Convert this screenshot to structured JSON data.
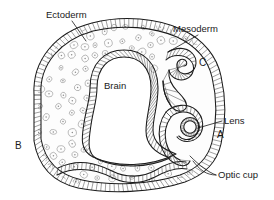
{
  "figure": {
    "background_color": "#ffffff",
    "ink_color": "#1a1a1a",
    "cell_color": "#8d8d8d",
    "width": 274,
    "height": 200
  },
  "labels": {
    "ectoderm": "Ectoderm",
    "mesoderm": "Mesoderm",
    "brain": "Brain",
    "lens": "Lens",
    "optic_cup": "Optic cup",
    "marker_a": "A",
    "marker_b": "B",
    "marker_c": "C"
  },
  "annotations": [
    {
      "name": "ectoderm",
      "text": "Ectoderm",
      "x": 46,
      "y": 11,
      "leader": true
    },
    {
      "name": "mesoderm",
      "text": "Mesoderm",
      "x": 173,
      "y": 25,
      "leader": true
    },
    {
      "name": "brain",
      "text": "Brain",
      "x": 104,
      "y": 82,
      "leader": false
    },
    {
      "name": "marker-c",
      "text": "C",
      "x": 199,
      "y": 59,
      "leader": false
    },
    {
      "name": "lens",
      "text": "Lens",
      "x": 224,
      "y": 117,
      "leader": true
    },
    {
      "name": "marker-a",
      "text": "A",
      "x": 217,
      "y": 131,
      "leader": false
    },
    {
      "name": "marker-b",
      "text": "B",
      "x": 16,
      "y": 142,
      "leader": false
    },
    {
      "name": "optic-cup",
      "text": "Optic cup",
      "x": 218,
      "y": 171,
      "leader": true
    }
  ],
  "structures": [
    {
      "name": "surface-ectoderm",
      "description": "columnar epithelial sheet forming the outer boundary of the embryo"
    },
    {
      "name": "mesoderm",
      "description": "loose mesenchyme filling the body cavity"
    },
    {
      "name": "neural-tube-brain",
      "description": "central hatched epithelial tube enclosing the brain lumen"
    },
    {
      "name": "optic-vesicle-c",
      "description": "early optic vesicle, stage C, upper right"
    },
    {
      "name": "optic-cup-a",
      "description": "invaginated optic cup with lens placode, stage A, lower right"
    }
  ]
}
